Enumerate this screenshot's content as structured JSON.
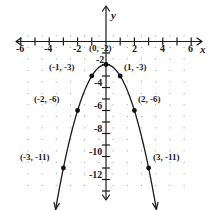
{
  "figure": {
    "axis_x_name": "x",
    "axis_y_name": "y"
  },
  "chart_data": {
    "type": "scatter",
    "title": "",
    "xlabel": "x",
    "ylabel": "y",
    "xlim": [
      -6.5,
      6.5
    ],
    "ylim": [
      -13.5,
      1.5
    ],
    "grid": true,
    "grid_style": "dotted",
    "function": "y = -x^2 - 2",
    "curve_shape": "downward parabola with vertex at (0, -2)",
    "x_ticks": [
      -6,
      -4,
      -2,
      2,
      4,
      6
    ],
    "x_tick_labels": [
      "-6",
      "-4",
      "-2",
      "2",
      "4",
      "6"
    ],
    "y_ticks": [
      -2,
      -4,
      -6,
      -8,
      -10,
      -12
    ],
    "y_tick_labels": [
      "-2",
      "-4",
      "-6",
      "-8",
      "-10",
      "-12"
    ],
    "points": [
      {
        "x": -3,
        "y": -11,
        "label": "(-3, -11)",
        "label_side": "left"
      },
      {
        "x": -2,
        "y": -6,
        "label": "(-2, -6)",
        "label_side": "left"
      },
      {
        "x": -1,
        "y": -3,
        "label": "(-1, -3)",
        "label_side": "left"
      },
      {
        "x": 0,
        "y": -2,
        "label": "(0, -2)",
        "label_side": "above"
      },
      {
        "x": 1,
        "y": -3,
        "label": "(1, -3)",
        "label_side": "right"
      },
      {
        "x": 2,
        "y": -6,
        "label": "(2, -6)",
        "label_side": "right"
      },
      {
        "x": 3,
        "y": -11,
        "label": "(3, -11)",
        "label_side": "right"
      }
    ],
    "series": [
      {
        "name": "y = -x^2 - 2",
        "x": [
          -3,
          -2,
          -1,
          0,
          1,
          2,
          3
        ],
        "values": [
          -11,
          -6,
          -3,
          -2,
          -3,
          -6,
          -11
        ]
      }
    ],
    "colors": {
      "axis": "#1a1a1a",
      "curve": "#1a1a1a",
      "point": "#111111",
      "grid": "#9a9a9a",
      "background": "#ffffff"
    }
  }
}
